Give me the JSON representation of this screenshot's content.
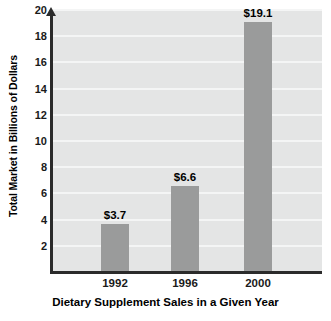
{
  "chart_data": {
    "type": "bar",
    "title": "",
    "categories": [
      "1992",
      "1996",
      "2000"
    ],
    "values": [
      3.7,
      6.6,
      19.1
    ],
    "value_labels": [
      "$3.7",
      "$6.6",
      "$19.1"
    ],
    "xlabel": "Dietary Supplement Sales in a Given Year",
    "ylabel": "Total Market in Billions of Dollars",
    "ylim": [
      0,
      20
    ],
    "xlim_note": "categorical",
    "y_ticks": [
      2,
      4,
      6,
      8,
      10,
      12,
      14,
      16,
      18,
      20
    ],
    "y_tick_labels": [
      "2",
      "4",
      "6",
      "8",
      "10",
      "12",
      "14",
      "16",
      "18",
      "20"
    ],
    "grid": "horizontal-only",
    "legend": "none",
    "series": [
      {
        "name": "Total Market",
        "values": [
          3.7,
          6.6,
          19.1
        ]
      }
    ],
    "colors": {
      "bar": "#9a9b9b",
      "plot_background": "#e4e5e5",
      "gridline": "#f4f5f5",
      "axis": "#2b2b2b",
      "text": "#000000",
      "page_background": "#ffffff"
    }
  }
}
